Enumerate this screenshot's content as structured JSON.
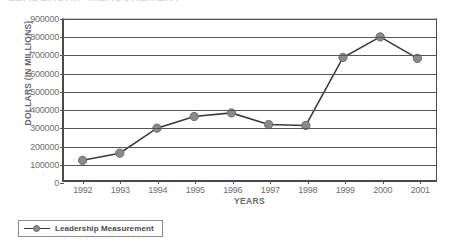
{
  "title_sliver_text": "LEADERSHIP MEASUREMENT",
  "legend": {
    "entries": [
      {
        "label": "Leadership Measurement",
        "symbol": "line-marker",
        "color": "#8a8a8a"
      }
    ]
  },
  "colors": {
    "series_line": "#3a3a3a",
    "series_marker": "#8a8a8a",
    "marker_border": "#6b6b6b",
    "gridline": "#555555",
    "axis": "#4a4a4a",
    "text": "#6f6f6f"
  },
  "chart_data": {
    "type": "line",
    "title": "",
    "xlabel": "YEARS",
    "ylabel": "DOLLARS (IN MILLIONS)",
    "categories": [
      "1992",
      "1993",
      "1994",
      "1995",
      "1996",
      "1997",
      "1998",
      "1999",
      "2000",
      "2001"
    ],
    "ytick_labels": [
      "0",
      "100000",
      "200000",
      "300000",
      "400000",
      "500000",
      "600000",
      "700000",
      "800000",
      "900000"
    ],
    "yticks": [
      0,
      100000,
      200000,
      300000,
      400000,
      500000,
      600000,
      700000,
      800000,
      900000
    ],
    "ylim": [
      0,
      900000
    ],
    "grid": "horizontal",
    "legend_position": "bottom-left",
    "series": [
      {
        "name": "Leadership Measurement",
        "values": [
          110000,
          150000,
          290000,
          355000,
          375000,
          310000,
          305000,
          685000,
          800000,
          680000
        ]
      }
    ]
  }
}
